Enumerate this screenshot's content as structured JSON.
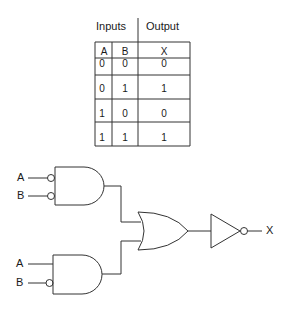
{
  "truth_table": {
    "group_headers": {
      "inputs": "Inputs",
      "output": "Output"
    },
    "columns": [
      "A",
      "B",
      "X"
    ],
    "rows": [
      [
        "0",
        "0",
        "0"
      ],
      [
        "0",
        "1",
        "1"
      ],
      [
        "1",
        "0",
        "0"
      ],
      [
        "1",
        "1",
        "1"
      ]
    ]
  },
  "circuit": {
    "gate1": {
      "type": "AND",
      "inputs": [
        {
          "label": "A",
          "inverted": true
        },
        {
          "label": "B",
          "inverted": true
        }
      ]
    },
    "gate2": {
      "type": "AND",
      "inputs": [
        {
          "label": "A",
          "inverted": false
        },
        {
          "label": "B",
          "inverted": true
        }
      ]
    },
    "gate3": {
      "type": "OR"
    },
    "gate4": {
      "type": "NOT"
    },
    "output_label": "X"
  },
  "colors": {
    "line": "#333333",
    "background": "#ffffff"
  }
}
